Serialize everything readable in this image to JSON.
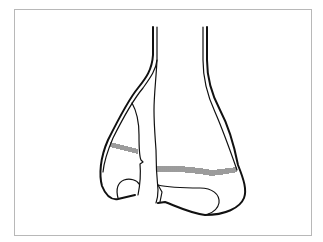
{
  "diagram": {
    "stroke_color": "#111111",
    "frame_color": "#b8b8b8",
    "background": "#ffffff",
    "parts": [
      {
        "name": "tibia-shaft",
        "label": ""
      },
      {
        "name": "fibula",
        "label": ""
      },
      {
        "name": "fracture-line",
        "label": ""
      },
      {
        "name": "growth-plate-tibia",
        "label": ""
      },
      {
        "name": "growth-plate-fibula",
        "label": ""
      },
      {
        "name": "talar-surface",
        "label": ""
      }
    ]
  }
}
